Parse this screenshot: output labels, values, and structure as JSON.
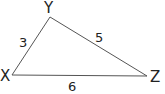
{
  "diagram": {
    "type": "triangle",
    "stroke_color": "#555555",
    "text_color": "#222222",
    "vertices": [
      {
        "name": "X",
        "label": "X"
      },
      {
        "name": "Y",
        "label": "Y"
      },
      {
        "name": "Z",
        "label": "Z"
      }
    ],
    "sides": [
      {
        "between": "XY",
        "label": "3"
      },
      {
        "between": "YZ",
        "label": "5"
      },
      {
        "between": "XZ",
        "label": "6"
      }
    ]
  }
}
